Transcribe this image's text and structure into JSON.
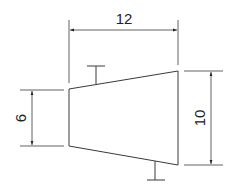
{
  "drawing": {
    "shape": "trapezoid",
    "dimensions": {
      "top_width": "12",
      "left_height": "6",
      "right_height": "10"
    },
    "marks": [
      "taper-mark-top",
      "taper-mark-bottom"
    ]
  }
}
